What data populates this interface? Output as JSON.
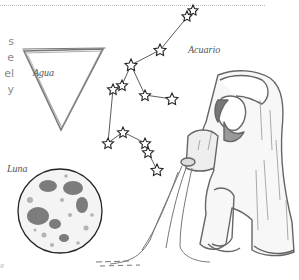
{
  "page": {
    "side_text_fragments": [
      "s",
      "e",
      "el",
      "y"
    ],
    "footer_fragment": "e"
  },
  "illustrations": {
    "water_symbol": {
      "label": "Agua",
      "shape": "inverted-triangle"
    },
    "constellation": {
      "label": "Acuario"
    },
    "moon": {
      "label": "Luna"
    },
    "figure": {
      "name": "water-bearer-engraving"
    }
  },
  "colors": {
    "ink": "#3a3a3a",
    "engraving": "#6b6b6b",
    "divider": "#b9b9b9",
    "side_text": "#8a8a8a"
  }
}
